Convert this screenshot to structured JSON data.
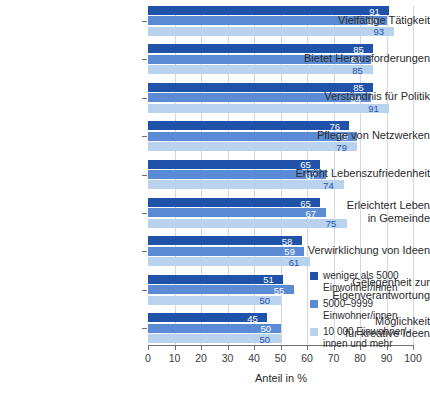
{
  "chart_data": {
    "type": "bar",
    "orientation": "horizontal",
    "title": "",
    "xlabel": "Anteil in %",
    "ylabel": "",
    "xlim": [
      0,
      100
    ],
    "xticks": [
      0,
      10,
      20,
      30,
      40,
      50,
      60,
      70,
      80,
      90,
      100
    ],
    "grid": true,
    "grid_axis": "x",
    "legend_position": "inside-bottom-right",
    "categories": [
      "Vielfältige Tätigkeit",
      "Bietet Herausforderungen",
      "Verständnis für Politik",
      "Pflege von Netzwerken",
      "Erhöht Lebenszufriedenheit",
      "Erleichtert Leben in Gemeinde",
      "Verwirklichung von Ideen",
      "Gelegenheit zur Eigenverantwortung",
      "Möglichkeit für kreative Ideen"
    ],
    "category_lines": [
      [
        "Vielfältige Tätigkeit"
      ],
      [
        "Bietet Herausforderungen"
      ],
      [
        "Verständnis für Politik"
      ],
      [
        "Pflege von Netzwerken"
      ],
      [
        "Erhöht Lebenszufriedenheit"
      ],
      [
        "Erleichtert Leben",
        "in Gemeinde"
      ],
      [
        "Verwirklichung von Ideen"
      ],
      [
        "Gelegenheit zur",
        "Eigenverantwortung"
      ],
      [
        "Möglichkeit",
        "für kreative Ideen"
      ]
    ],
    "series": [
      {
        "name": "weniger als 5000 Einwohner/innen",
        "color": "#1f52a8",
        "values": [
          91,
          85,
          85,
          76,
          65,
          65,
          58,
          51,
          45
        ]
      },
      {
        "name": "5000–9999 Einwohner/innen",
        "color": "#5b8bd4",
        "values": [
          90,
          84,
          84,
          79,
          67,
          67,
          59,
          55,
          50
        ]
      },
      {
        "name": "10 000 Einwohner/-innen und mehr",
        "color": "#b9d3ef",
        "values": [
          93,
          85,
          91,
          79,
          74,
          75,
          61,
          50,
          50
        ]
      }
    ]
  },
  "legend": {
    "entries": [
      {
        "lines": [
          "weniger als 5000",
          "Einwohner/innen"
        ],
        "color": "#1f52a8"
      },
      {
        "lines": [
          "5000–9999",
          "Einwohner/innen"
        ],
        "color": "#5b8bd4"
      },
      {
        "lines": [
          "10 000 Einwohner/-",
          "innen und mehr"
        ],
        "color": "#b9d3ef"
      }
    ]
  },
  "axis": {
    "x_title": "Anteil in %",
    "x_tick_labels": [
      "0",
      "10",
      "20",
      "30",
      "40",
      "50",
      "60",
      "70",
      "80",
      "90",
      "100"
    ]
  }
}
